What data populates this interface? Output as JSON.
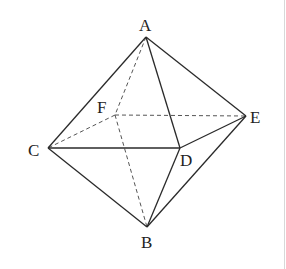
{
  "diagram": {
    "type": "octahedron",
    "vertices": {
      "A": {
        "label": "A",
        "x": 146,
        "y": 37
      },
      "B": {
        "label": "B",
        "x": 147,
        "y": 227
      },
      "C": {
        "label": "C",
        "x": 48,
        "y": 148
      },
      "D": {
        "label": "D",
        "x": 180,
        "y": 148
      },
      "E": {
        "label": "E",
        "x": 246,
        "y": 116
      },
      "F": {
        "label": "F",
        "x": 115,
        "y": 115
      }
    },
    "solid_edges": [
      "AC",
      "AD",
      "AE",
      "CD",
      "DE",
      "CB",
      "DB",
      "EB"
    ],
    "dashed_edges": [
      "AF",
      "FE",
      "FC",
      "FB"
    ],
    "labels": {
      "A": "A",
      "B": "B",
      "C": "C",
      "D": "D",
      "E": "E",
      "F": "F"
    },
    "colors": {
      "line": "#2a2a2a",
      "dashed_line": "#555555",
      "text": "#222222",
      "background": "#ffffff"
    }
  }
}
